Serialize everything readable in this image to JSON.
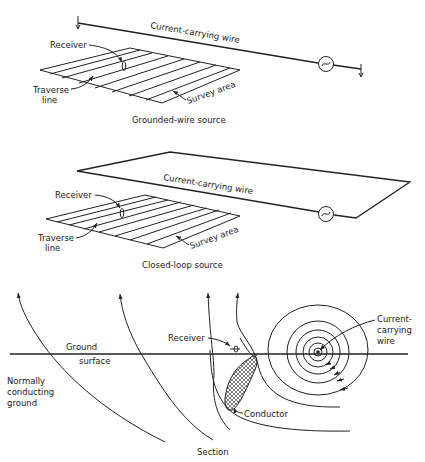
{
  "panels": {
    "grounded": {
      "caption": "Grounded-wire source",
      "wire_label": "Current-carrying wire",
      "receiver_label": "Receiver",
      "traverse_label_1": "Traverse",
      "traverse_label_2": "line",
      "survey_label": "Survey area"
    },
    "closed_loop": {
      "caption": "Closed-loop source",
      "wire_label": "Current-carrying wire",
      "receiver_label": "Receiver",
      "traverse_label_1": "Traverse",
      "traverse_label_2": "line",
      "survey_label": "Survey area"
    },
    "section": {
      "caption": "Section",
      "ground_label": "Ground",
      "surface_label": "surface",
      "normal_label_1": "Normally",
      "normal_label_2": "conducting",
      "normal_label_3": "ground",
      "receiver_label": "Receiver",
      "conductor_label": "Conductor",
      "wire_label_1": "Current-",
      "wire_label_2": "carrying",
      "wire_label_3": "wire"
    }
  },
  "icons": {
    "generator": "ac-source-icon"
  }
}
